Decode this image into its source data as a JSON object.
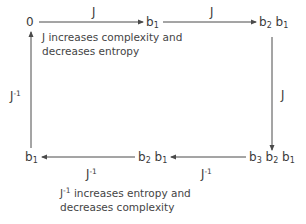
{
  "diagram": {
    "nodes": {
      "top_left": "0",
      "top_mid": {
        "parts": [
          {
            "b": "b",
            "s": "1"
          }
        ]
      },
      "top_right": {
        "parts": [
          {
            "b": "b",
            "s": "2"
          },
          {
            "b": "b",
            "s": "1"
          }
        ]
      },
      "bottom_right": {
        "parts": [
          {
            "b": "b",
            "s": "3"
          },
          {
            "b": "b",
            "s": "2"
          },
          {
            "b": "b",
            "s": "1"
          }
        ]
      },
      "bottom_mid": {
        "parts": [
          {
            "b": "b",
            "s": "2"
          },
          {
            "b": "b",
            "s": "1"
          }
        ]
      },
      "bottom_left": {
        "parts": [
          {
            "b": "b",
            "s": "1"
          }
        ]
      }
    },
    "edge_labels": {
      "top_1": "J",
      "top_2": "J",
      "right": "J",
      "bottom_1": {
        "base": "J",
        "sup": "-1"
      },
      "bottom_2": {
        "base": "J",
        "sup": "-1"
      },
      "left": {
        "base": "J",
        "sup": "-1"
      }
    },
    "notes": {
      "top_line1": "J increases complexity and",
      "top_line2": "decreases entropy",
      "bottom_base": "J",
      "bottom_sup": "-1",
      "bottom_line1_rest": " increases entropy and",
      "bottom_line2": "decreases complexity"
    },
    "colors": {
      "line": "#4a4a4a",
      "text": "#3a3a3a"
    }
  }
}
